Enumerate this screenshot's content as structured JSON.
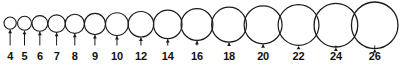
{
  "figure": {
    "background_color": "#ffffff",
    "stroke_color": "#1a1a1a",
    "label_color": "#111111",
    "label_font_size": 11,
    "label_baseline_y": 60,
    "arrow_color": "#1a1a1a",
    "units": "mm",
    "canvas": {
      "width": 402,
      "height": 66
    }
  },
  "chart_data": {
    "type": "scatter",
    "xlabel": "",
    "ylabel": "",
    "categories": [
      "4",
      "5",
      "6",
      "7",
      "8",
      "9",
      "10",
      "12",
      "14",
      "16",
      "18",
      "20",
      "22",
      "24",
      "26"
    ],
    "values": [
      4,
      5,
      6,
      7,
      8,
      9,
      10,
      12,
      14,
      16,
      18,
      20,
      22,
      24,
      26
    ],
    "series": [
      {
        "name": "circle diameter",
        "values": [
          4,
          5,
          6,
          7,
          8,
          9,
          10,
          12,
          14,
          16,
          18,
          20,
          22,
          24,
          26
        ]
      }
    ],
    "legend": "none",
    "grid": false,
    "annotations": [
      "4",
      "5",
      "6",
      "7",
      "8",
      "9",
      "10",
      "12",
      "14",
      "16",
      "18",
      "20",
      "22",
      "24",
      "26"
    ]
  },
  "circles": [
    {
      "label": "4",
      "value": 4,
      "cx": 21.0,
      "cy": 17.0,
      "r": 6.4,
      "stroke_width": 1.1,
      "arrow_top_y": 23.4,
      "arrow_bottom_y": 45.5,
      "label_x": 21.0
    },
    {
      "label": "5",
      "value": 5,
      "cx": 36.0,
      "cy": 16.3,
      "r": 7.3,
      "stroke_width": 1.1,
      "arrow_top_y": 23.6,
      "arrow_bottom_y": 45.5,
      "label_x": 36.0
    },
    {
      "label": "6",
      "value": 6,
      "cx": 52.0,
      "cy": 15.6,
      "r": 8.2,
      "stroke_width": 1.1,
      "arrow_top_y": 23.8,
      "arrow_bottom_y": 45.5,
      "label_x": 52.0
    },
    {
      "label": "7",
      "value": 7,
      "cx": 69.5,
      "cy": 14.9,
      "r": 9.1,
      "stroke_width": 1.1,
      "arrow_top_y": 24.0,
      "arrow_bottom_y": 45.5,
      "label_x": 69.5
    },
    {
      "label": "8",
      "value": 8,
      "cx": 88.5,
      "cy": 14.2,
      "r": 10.0,
      "stroke_width": 1.1,
      "arrow_top_y": 24.2,
      "arrow_bottom_y": 45.5,
      "label_x": 88.5
    },
    {
      "label": "9",
      "value": 9,
      "cx": 109.5,
      "cy": 13.4,
      "r": 11.0,
      "stroke_width": 1.1,
      "arrow_top_y": 24.4,
      "arrow_bottom_y": 45.5,
      "label_x": 109.5
    },
    {
      "label": "10",
      "value": 10,
      "cx": 132.5,
      "cy": 12.7,
      "r": 11.9,
      "stroke_width": 1.1,
      "arrow_top_y": 24.6,
      "arrow_bottom_y": 45.5,
      "label_x": 132.5
    },
    {
      "label": "12",
      "value": 12,
      "cx": 157.5,
      "cy": 11.5,
      "r": 13.3,
      "stroke_width": 1.2,
      "arrow_top_y": 24.8,
      "arrow_bottom_y": 45.5,
      "label_x": 157.5
    },
    {
      "label": "14",
      "value": 14,
      "cx": 185.5,
      "cy": 10.1,
      "r": 14.9,
      "stroke_width": 1.2,
      "arrow_top_y": 25.0,
      "arrow_bottom_y": 45.5,
      "label_x": 185.5
    },
    {
      "label": "16",
      "value": 16,
      "cx": 216.0,
      "cy": 8.6,
      "r": 16.6,
      "stroke_width": 1.2,
      "arrow_top_y": 25.2,
      "arrow_bottom_y": 45.5,
      "label_x": 216.0
    },
    {
      "label": "18",
      "value": 18,
      "cx": 249.5,
      "cy": 7.2,
      "r": 18.2,
      "stroke_width": 1.2,
      "arrow_top_y": 25.4,
      "arrow_bottom_y": 45.5,
      "label_x": 249.5
    },
    {
      "label": "20",
      "value": 20,
      "cx": 285.0,
      "cy": 5.9,
      "r": 19.8,
      "stroke_width": 1.2,
      "arrow_top_y": 25.7,
      "arrow_bottom_y": 45.5,
      "label_x": 285.0
    },
    {
      "label": "22",
      "value": 22,
      "cx": 322.0,
      "cy": 4.6,
      "r": 21.3,
      "stroke_width": 1.2,
      "arrow_top_y": 25.9,
      "arrow_bottom_y": 45.5,
      "label_x": 322.0
    },
    {
      "label": "24",
      "value": 24,
      "cx": 361.0,
      "cy": 3.3,
      "r": 22.8,
      "stroke_width": 1.3,
      "arrow_top_y": 26.1,
      "arrow_bottom_y": 45.5,
      "label_x": 361.0
    },
    {
      "label": "26",
      "value": 26,
      "cx": 401.5,
      "cy": 2.0,
      "r": 24.3,
      "stroke_width": 1.3,
      "arrow_top_y": 26.3,
      "arrow_bottom_y": 45.5,
      "label_x": 401.5
    }
  ]
}
